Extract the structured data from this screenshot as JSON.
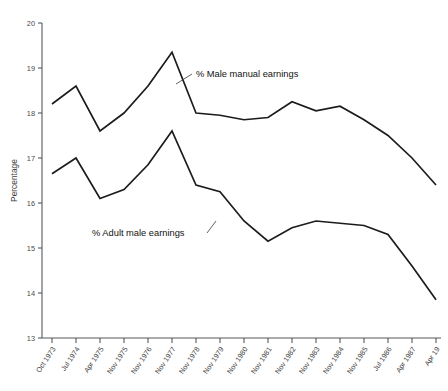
{
  "chart_data": {
    "type": "line",
    "title": "",
    "xlabel": "",
    "ylabel": "Percentage",
    "ylim": [
      13,
      20
    ],
    "yticks": [
      13,
      14,
      15,
      16,
      17,
      18,
      19,
      20
    ],
    "ytick_labels": [
      "13",
      "14",
      "15",
      "16",
      "17",
      "18",
      "19",
      "20"
    ],
    "grid": false,
    "legend": "inline-annotations",
    "categories": [
      "Oct 1973",
      "Jul 1974",
      "Apr 1975",
      "Nov 1975",
      "Nov 1976",
      "Nov 1977",
      "Nov 1978",
      "Nov 1979",
      "Nov 1980",
      "Nov 1981",
      "Nov 1982",
      "Nov 1983",
      "Nov 1984",
      "Nov 1985",
      "Jul 1986",
      "Apr 1987",
      "Apr 19"
    ],
    "series": [
      {
        "name": "% Male manual earnings",
        "values": [
          18.2,
          18.6,
          17.6,
          18.0,
          18.6,
          19.35,
          18.0,
          17.95,
          17.85,
          17.9,
          18.25,
          18.05,
          18.15,
          17.85,
          17.5,
          17.0,
          16.4
        ]
      },
      {
        "name": "% Adult male earnings",
        "values": [
          16.65,
          17.0,
          16.1,
          16.3,
          16.85,
          17.6,
          16.4,
          16.25,
          15.6,
          15.15,
          15.45,
          15.6,
          15.55,
          15.5,
          15.3,
          14.6,
          13.85
        ]
      }
    ],
    "annotations": [
      {
        "text": "% Male manual earnings",
        "text_x": 196,
        "text_y": 77,
        "leader": [
          [
            192,
            74
          ],
          [
            176,
            84
          ]
        ]
      },
      {
        "text": "% Adult male earnings",
        "text_x": 92,
        "text_y": 236,
        "leader": [
          [
            207,
            233
          ],
          [
            216,
            221
          ]
        ]
      }
    ],
    "colors": {
      "line": "#1c1c1c",
      "axis": "#55595c",
      "tick_text": "#4a4a4a",
      "annotation_text": "#111111",
      "background": "#ffffff"
    }
  },
  "layout": {
    "plot_left": 42,
    "plot_right": 441,
    "plot_top": 23,
    "plot_bottom": 338,
    "x_first_tick": 52,
    "x_step": 24
  }
}
